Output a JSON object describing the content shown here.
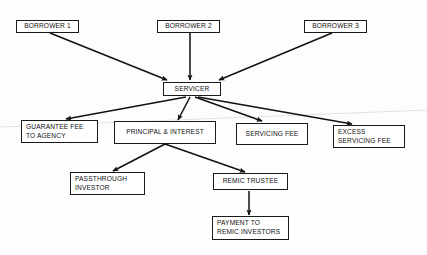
{
  "diagram": {
    "canvas": {
      "width": 427,
      "height": 255
    },
    "colors": {
      "background": "#fdfdfd",
      "box_border": "#1a1a1a",
      "box_fill": "#ffffff",
      "text": "#101010",
      "arrow": "#111111",
      "scan_artifact": "#e2e2e2"
    },
    "nodes": [
      {
        "id": "borrower1",
        "label": "BORROWER 1",
        "x": 16,
        "y": 20,
        "w": 63,
        "h": 13,
        "align": "center"
      },
      {
        "id": "borrower2",
        "label": "BORROWER 2",
        "x": 157,
        "y": 20,
        "w": 63,
        "h": 13,
        "align": "center"
      },
      {
        "id": "borrower3",
        "label": "BORROWER 3",
        "x": 304,
        "y": 20,
        "w": 63,
        "h": 13,
        "align": "center"
      },
      {
        "id": "servicer",
        "label": "SERVICER",
        "x": 163,
        "y": 82,
        "w": 58,
        "h": 14,
        "align": "center"
      },
      {
        "id": "guarantee_fee",
        "label": "GUARANTEE FEE\nTO AGENCY",
        "x": 21,
        "y": 120,
        "w": 77,
        "h": 23,
        "align": "left"
      },
      {
        "id": "principal_interest",
        "label": "PRINCIPAL & INTEREST",
        "x": 114,
        "y": 121,
        "w": 102,
        "h": 23,
        "align": "center"
      },
      {
        "id": "servicing_fee",
        "label": "SERVICING FEE",
        "x": 236,
        "y": 123,
        "w": 72,
        "h": 22,
        "align": "center"
      },
      {
        "id": "excess_servicing_fee",
        "label": "EXCESS\nSERVICING FEE",
        "x": 333,
        "y": 125,
        "w": 72,
        "h": 23,
        "align": "left"
      },
      {
        "id": "passthrough_investor",
        "label": "PASSTHROUGH\nINVESTOR",
        "x": 70,
        "y": 172,
        "w": 75,
        "h": 23,
        "align": "left"
      },
      {
        "id": "remic_trustee",
        "label": "REMIC TRUSTEE",
        "x": 213,
        "y": 173,
        "w": 75,
        "h": 17,
        "align": "center"
      },
      {
        "id": "payment_remic_investors",
        "label": "PAYMENT TO\nREMIC INVESTORS",
        "x": 212,
        "y": 216,
        "w": 77,
        "h": 24,
        "align": "left"
      }
    ],
    "edges": [
      {
        "id": "borrower1-to-servicer",
        "from": "borrower1",
        "to": "servicer",
        "x1": 50,
        "y1": 33,
        "x2": 167,
        "y2": 80
      },
      {
        "id": "borrower2-to-servicer",
        "from": "borrower2",
        "to": "servicer",
        "x1": 190,
        "y1": 33,
        "x2": 190,
        "y2": 80
      },
      {
        "id": "borrower3-to-servicer",
        "from": "borrower3",
        "to": "servicer",
        "x1": 332,
        "y1": 33,
        "x2": 219,
        "y2": 80
      },
      {
        "id": "servicer-to-guarantee-fee",
        "from": "servicer",
        "to": "guarantee_fee",
        "x1": 186,
        "y1": 97,
        "x2": 66,
        "y2": 119
      },
      {
        "id": "servicer-to-principal-interest",
        "from": "servicer",
        "to": "principal_interest",
        "x1": 190,
        "y1": 97,
        "x2": 178,
        "y2": 120
      },
      {
        "id": "servicer-to-servicing-fee",
        "from": "servicer",
        "to": "servicing_fee",
        "x1": 195,
        "y1": 97,
        "x2": 262,
        "y2": 121
      },
      {
        "id": "servicer-to-excess-servicing-fee",
        "from": "servicer",
        "to": "excess_servicing_fee",
        "x1": 198,
        "y1": 97,
        "x2": 352,
        "y2": 124
      },
      {
        "id": "principal-interest-to-passthrough",
        "from": "principal_interest",
        "to": "passthrough_investor",
        "x1": 165,
        "y1": 144,
        "x2": 113,
        "y2": 171
      },
      {
        "id": "principal-interest-to-remic-trustee",
        "from": "principal_interest",
        "to": "remic_trustee",
        "x1": 165,
        "y1": 144,
        "x2": 245,
        "y2": 172
      },
      {
        "id": "remic-trustee-to-payment",
        "from": "remic_trustee",
        "to": "payment_remic_investors",
        "x1": 249,
        "y1": 191,
        "x2": 249,
        "y2": 215
      }
    ],
    "artifacts": [
      {
        "id": "scan-line",
        "x1": 0,
        "y1": 127,
        "x2": 427,
        "y2": 110
      }
    ]
  }
}
